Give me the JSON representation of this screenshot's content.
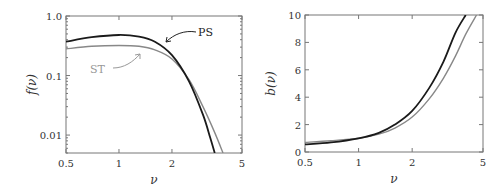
{
  "chart_data": [
    {
      "type": "line",
      "title": "",
      "xlabel": "ν",
      "ylabel": "f(ν)",
      "xscale": "log",
      "yscale": "log",
      "xlim": [
        0.5,
        5
      ],
      "ylim": [
        0.005,
        1.0
      ],
      "xticks": [
        "0.5",
        "1",
        "2",
        "5"
      ],
      "yticks": [
        "0.01",
        "0.1",
        "1.0"
      ],
      "grid": false,
      "series": [
        {
          "name": "PS",
          "color": "#1a1a1a",
          "x": [
            0.5,
            0.7,
            1.0,
            1.3,
            1.6,
            2.0,
            2.5,
            3.0,
            3.3,
            3.5
          ],
          "values": [
            0.37,
            0.44,
            0.48,
            0.45,
            0.37,
            0.22,
            0.08,
            0.022,
            0.009,
            0.005
          ]
        },
        {
          "name": "ST",
          "color": "#888888",
          "x": [
            0.5,
            0.7,
            1.0,
            1.3,
            1.6,
            2.0,
            2.5,
            3.0,
            3.5,
            3.9
          ],
          "values": [
            0.28,
            0.31,
            0.32,
            0.31,
            0.27,
            0.19,
            0.085,
            0.03,
            0.011,
            0.005
          ]
        }
      ],
      "annotations": [
        "PS",
        "ST"
      ]
    },
    {
      "type": "line",
      "title": "",
      "xlabel": "ν",
      "ylabel": "b(ν)",
      "xscale": "log",
      "yscale": "linear",
      "xlim": [
        0.5,
        5
      ],
      "ylim": [
        0,
        10
      ],
      "xticks": [
        "0.5",
        "1",
        "2",
        "5"
      ],
      "yticks": [
        "0",
        "2",
        "4",
        "6",
        "8",
        "10"
      ],
      "grid": false,
      "series": [
        {
          "name": "PS",
          "color": "#1a1a1a",
          "x": [
            0.5,
            0.7,
            1.0,
            1.3,
            1.6,
            2.0,
            2.5,
            3.0,
            3.5,
            4.0
          ],
          "values": [
            0.55,
            0.7,
            1.0,
            1.4,
            2.0,
            3.0,
            4.7,
            6.6,
            8.7,
            10.0
          ]
        },
        {
          "name": "ST",
          "color": "#888888",
          "x": [
            0.5,
            0.7,
            1.0,
            1.3,
            1.6,
            2.0,
            2.5,
            3.0,
            3.5,
            4.0,
            4.6
          ],
          "values": [
            0.7,
            0.82,
            1.0,
            1.3,
            1.75,
            2.55,
            3.9,
            5.4,
            7.0,
            8.6,
            10.0
          ]
        }
      ]
    }
  ],
  "labels": {
    "ps": "PS",
    "st": "ST",
    "nu": "ν",
    "f_label": "f(ν)",
    "b_label": "b(ν)"
  }
}
